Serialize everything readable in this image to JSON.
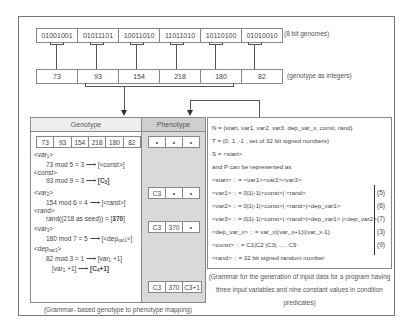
{
  "genomes": {
    "bits": [
      "01001001",
      "01011101",
      "10011010",
      "11011010",
      "10110100",
      "01010010"
    ],
    "note": "(8 bit genomes)"
  },
  "integers": {
    "values": [
      "73",
      "93",
      "154",
      "218",
      "180",
      "82"
    ],
    "note": "(genotype as integers)"
  },
  "genotype_panel": {
    "title": "Genotype",
    "values": [
      "73",
      "93",
      "154",
      "218",
      "180",
      "82"
    ],
    "steps": [
      {
        "label": "<var",
        "sub": "1",
        "label_end": ">",
        "expr": "73 mod 5 = 3",
        "result": "[<const>]"
      },
      {
        "label": "<const>",
        "expr": "93 mod 9 = 3",
        "result": "[C",
        "result_sub": "3",
        "result_end": "]"
      },
      {
        "label": "<var",
        "sub": "2",
        "label_end": ">",
        "expr": "154 mod 6 = 4",
        "result": "[<rand>]"
      },
      {
        "label": "<rand>",
        "expr": "rand((218 as seed)) = [",
        "result": "370",
        "result_end": "]"
      },
      {
        "label": "<var",
        "sub": "3",
        "label_end": ">",
        "expr": "180 mod 7 = 5",
        "result": "[<dep",
        "result_sub": "var1",
        "result_end": ">]"
      },
      {
        "label": "<dep",
        "sub": "var1",
        "label_end": ">",
        "expr": "82 mod 3 = 1",
        "result": "[var",
        "result_sub": "1",
        "result_end": " +1]"
      },
      {
        "expr": "[var",
        "expr_sub": "1",
        "expr_end": " +1]",
        "result": "[C",
        "result_sub": "4",
        "result_end": "+1]"
      }
    ],
    "caption": "(Grammar- based genotype to phenotype mapping)"
  },
  "phenotype_panel": {
    "title": "Phenotype",
    "rows": [
      [
        "•",
        "•",
        "•"
      ],
      [
        "C3",
        "•",
        "•"
      ],
      [
        "C3",
        "370",
        "•"
      ],
      [
        "C3",
        "370",
        "C3+1"
      ]
    ]
  },
  "grammar_panel": {
    "lines": [
      {
        "text": "N = {start, var1, var2, var3, dep_var_x, const, rand}"
      },
      {
        "text": "T = {0, 1 ,-1 , set of 32 bit signed numbers}"
      },
      {
        "text": "S = <start>"
      },
      {
        "text": "and P can be represented as"
      },
      {
        "text": "<start> :: = <var1><var2><var3>"
      },
      {
        "text": "<var1> :: = 0|1|-1|<const>| <rand>",
        "ref": "(5)"
      },
      {
        "text": "<var2> :: = 0|1|-1|<const>| <rand>|<dep_var1>",
        "ref": "(6)"
      },
      {
        "text": "<var3> :: = 0|1|-1|<const>| <rand>|<dep_var1> |<dep_var2>",
        "ref": "(7)"
      },
      {
        "text": "<dep_var_x> :: = var_x|(var_x+1)|(var_x-1)",
        "ref": "(3)"
      },
      {
        "text": "<const> :: = C1|C2 |C3| ..... C9",
        "ref": "(9)"
      },
      {
        "text": "<rand> :: = 32 bit signed random number"
      }
    ],
    "caption": "(Grammar for the generation of input data for a program having three input variables and nine constant values in condition predicates)"
  }
}
